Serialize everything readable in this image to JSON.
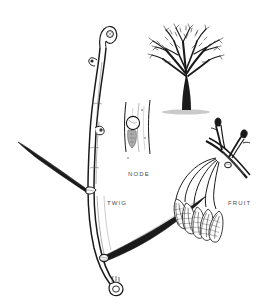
{
  "plate": {
    "kind": "botanical-line-drawing",
    "medium": "pen-and-ink",
    "background_color": "#ffffff",
    "ink_color": "#1a1a1a",
    "label_color": "#4a4a4a",
    "width": 267,
    "height": 308
  },
  "labels": {
    "node": "NODE",
    "twig": "TWIG",
    "fruit": "FRUIT"
  },
  "figures": [
    {
      "id": "twig",
      "label": "TWIG",
      "description": "Large stout twig rising at upper left-center with a hooked terminal bud, a lateral bud on the upper shaft, two dark tapered side branches, a node at the lower junction and an oval bud at the base.",
      "features": [
        "terminal-bud",
        "lateral-bud",
        "node",
        "basal-bud",
        "dark-side-branch"
      ]
    },
    {
      "id": "node",
      "label": "NODE",
      "description": "Enlarged detail inset of a bark segment showing a circular bud above a shield-shaped leaf scar, with vertical bark striations.",
      "features": [
        "bud",
        "leaf-scar",
        "bark-striation"
      ]
    },
    {
      "id": "tree",
      "label": "",
      "description": "Bare deciduous winter tree silhouette with short dark trunk, spreading crown of fine twigs and a thin ground shadow.",
      "features": [
        "trunk",
        "crown",
        "ground-shadow"
      ]
    },
    {
      "id": "fruit",
      "label": "FRUIT",
      "description": "Forked branch bearing dark terminal buds with a drooping cluster of five elongated winged samaras on long slender stalks.",
      "features": [
        "branch",
        "terminal-bud",
        "samara-cluster"
      ],
      "samara_count": 5
    }
  ]
}
